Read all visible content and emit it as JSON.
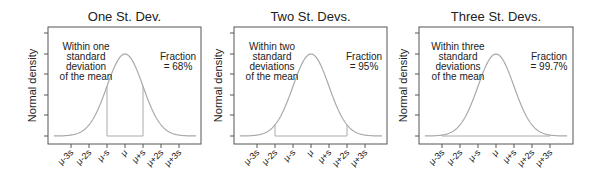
{
  "chart_data": [
    {
      "type": "line",
      "title": "One St. Dev.",
      "xlabel": "",
      "ylabel": "Normal density",
      "x_tick_labels": [
        "μ-3s",
        "μ-2s",
        "μ-s",
        "μ",
        "μ+s",
        "μ+2s",
        "μ+3s"
      ],
      "x_range_sd": [
        -4,
        4
      ],
      "shaded_interval_sd": [
        -1,
        1
      ],
      "annotation_left": [
        "Within one",
        "standard",
        "deviation",
        "of the mean"
      ],
      "annotation_right": [
        "Fraction",
        "= 68%"
      ],
      "fraction_percent": 68,
      "series": [
        {
          "name": "Normal density curve",
          "distribution": "normal",
          "mean": 0,
          "sd": 1
        }
      ],
      "grid": false
    },
    {
      "type": "line",
      "title": "Two St. Devs.",
      "xlabel": "",
      "ylabel": "Normal density",
      "x_tick_labels": [
        "μ-3s",
        "μ-2s",
        "μ-s",
        "μ",
        "μ+s",
        "μ+2s",
        "μ+3s"
      ],
      "x_range_sd": [
        -4,
        4
      ],
      "shaded_interval_sd": [
        -2,
        2
      ],
      "annotation_left": [
        "Within two",
        "standard",
        "deviations",
        "of the mean"
      ],
      "annotation_right": [
        "Fraction",
        "= 95%"
      ],
      "fraction_percent": 95,
      "series": [
        {
          "name": "Normal density curve",
          "distribution": "normal",
          "mean": 0,
          "sd": 1
        }
      ],
      "grid": false
    },
    {
      "type": "line",
      "title": "Three St. Devs.",
      "xlabel": "",
      "ylabel": "Normal density",
      "x_tick_labels": [
        "μ-3s",
        "μ-2s",
        "μ-s",
        "μ",
        "μ+s",
        "μ+2s",
        "μ+3s"
      ],
      "x_range_sd": [
        -4,
        4
      ],
      "shaded_interval_sd": [
        -3,
        3
      ],
      "annotation_left": [
        "Within three",
        "standard",
        "deviations",
        "of the mean"
      ],
      "annotation_right": [
        "Fraction",
        "= 99.7%"
      ],
      "fraction_percent": 99.7,
      "series": [
        {
          "name": "Normal density curve",
          "distribution": "normal",
          "mean": 0,
          "sd": 1
        }
      ],
      "grid": false
    }
  ],
  "colors": {
    "axis": "#555555",
    "curve": "#aaaaaa",
    "interval": "#aaaaaa",
    "text": "#222222"
  }
}
